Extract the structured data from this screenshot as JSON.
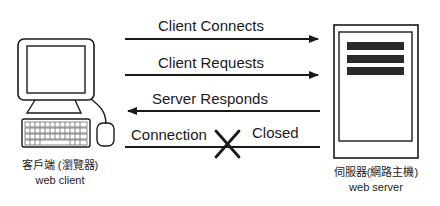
{
  "client": {
    "label_zh": "客戶端 (瀏覽器)",
    "label_en": "web client",
    "icon": "desktop-computer-icon"
  },
  "server": {
    "label_zh": "伺服器(網路主機)",
    "label_en": "web server",
    "icon": "server-tower-icon"
  },
  "messages": [
    {
      "label": "Client Connects",
      "direction": "client-to-server"
    },
    {
      "label": "Client Requests",
      "direction": "client-to-server"
    },
    {
      "label": "Server Responds",
      "direction": "server-to-client"
    },
    {
      "label_left": "Connection",
      "label_right": "Closed",
      "direction": "none",
      "marker": "x-icon"
    }
  ],
  "colors": {
    "stroke": "#1a1a1a",
    "background": "#ffffff",
    "server_bars": "#2a2a2a"
  }
}
